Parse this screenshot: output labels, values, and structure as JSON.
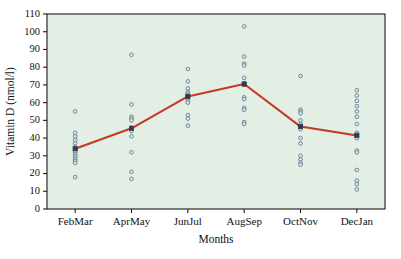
{
  "chart_data": {
    "type": "scatter",
    "title": "",
    "xlabel": "Months",
    "ylabel": "Vitamin D (nmol/l)",
    "categories": [
      "FebMar",
      "AprMay",
      "JunJul",
      "AugSep",
      "OctNov",
      "DecJan"
    ],
    "ylim": [
      0,
      110
    ],
    "yticks": [
      0,
      10,
      20,
      30,
      40,
      50,
      60,
      70,
      80,
      90,
      100,
      110
    ],
    "ytick_labels": [
      "0",
      "10",
      "20",
      "30",
      "40",
      "50",
      "60",
      "70",
      "80",
      "90",
      "100",
      "110"
    ],
    "grid": false,
    "legend": "none",
    "background_color": "#e3eee5",
    "point_color": "#5b7796",
    "line_color": "#c43a22",
    "mean_marker_color": "#2f3d52",
    "series": [
      {
        "name": "Mean Vitamin D",
        "type": "line",
        "values": [
          34.0,
          45.5,
          63.5,
          70.5,
          46.5,
          41.5
        ]
      }
    ],
    "scatter_points": [
      {
        "category": "FebMar",
        "values": [
          55,
          43,
          41,
          39,
          37,
          35,
          34,
          33,
          32,
          31,
          30,
          29,
          28,
          27,
          26,
          18
        ]
      },
      {
        "category": "AprMay",
        "values": [
          87,
          59,
          52,
          51,
          50,
          46,
          45,
          44,
          41,
          32,
          21,
          17
        ]
      },
      {
        "category": "JunJul",
        "values": [
          79,
          72,
          68,
          66,
          65,
          64,
          63,
          62,
          61,
          60,
          53,
          51,
          47
        ]
      },
      {
        "category": "AugSep",
        "values": [
          103,
          86,
          82,
          81,
          74,
          71,
          70,
          63,
          62,
          57,
          56,
          49,
          48
        ]
      },
      {
        "category": "OctNov",
        "values": [
          75,
          56,
          55,
          54,
          50,
          48,
          47,
          46,
          45,
          40,
          37,
          30,
          28,
          26,
          25
        ]
      },
      {
        "category": "DecJan",
        "values": [
          67,
          64,
          61,
          58,
          55,
          52,
          48,
          43,
          42,
          41,
          40,
          33,
          32,
          22,
          16,
          14,
          11
        ]
      }
    ]
  }
}
